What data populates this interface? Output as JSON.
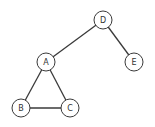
{
  "diagram": {
    "type": "graph",
    "directed": false,
    "node_radius": 9,
    "colors": {
      "stroke": "#3a3a3a",
      "fill": "#ffffff",
      "label": "#333333"
    },
    "nodes": [
      {
        "id": "D",
        "label": "D",
        "x": 103,
        "y": 20
      },
      {
        "id": "A",
        "label": "A",
        "x": 46,
        "y": 62
      },
      {
        "id": "E",
        "label": "E",
        "x": 134,
        "y": 62
      },
      {
        "id": "B",
        "label": "B",
        "x": 21,
        "y": 108
      },
      {
        "id": "C",
        "label": "C",
        "x": 70,
        "y": 108
      }
    ],
    "edges": [
      {
        "from": "D",
        "to": "A"
      },
      {
        "from": "D",
        "to": "E"
      },
      {
        "from": "A",
        "to": "B"
      },
      {
        "from": "A",
        "to": "C"
      },
      {
        "from": "B",
        "to": "C"
      }
    ]
  }
}
